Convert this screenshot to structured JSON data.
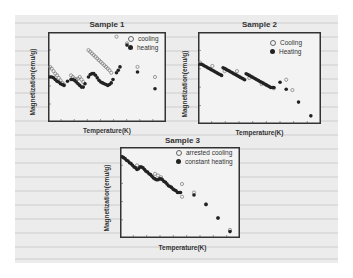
{
  "figure": {
    "background_color": "#ececec"
  },
  "chart_data": [
    {
      "type": "scatter",
      "title": "Sample 1",
      "xlabel": "Temperature(K)",
      "ylabel": "Magnetization(emu/g)",
      "grid": false,
      "legend_position": "upper right",
      "series": [
        {
          "name": "cooling",
          "marker": "open-circle",
          "points": [
            [
              0,
              0.62
            ],
            [
              0.5,
              0.6
            ],
            [
              1,
              0.57
            ],
            [
              1.5,
              0.54
            ],
            [
              2,
              0.52
            ],
            [
              2.5,
              0.49
            ],
            [
              3,
              0.46
            ],
            [
              3.5,
              0.43
            ],
            [
              4,
              0.41
            ],
            [
              6,
              0.52
            ],
            [
              6.5,
              0.5
            ],
            [
              7,
              0.48
            ],
            [
              7.5,
              0.47
            ],
            [
              8,
              0.48
            ],
            [
              8.5,
              0.5
            ],
            [
              9,
              0.47
            ],
            [
              9.5,
              0.44
            ],
            [
              11,
              0.82
            ],
            [
              11.5,
              0.8
            ],
            [
              12,
              0.78
            ],
            [
              12.5,
              0.76
            ],
            [
              13,
              0.74
            ],
            [
              13.5,
              0.72
            ],
            [
              14,
              0.7
            ],
            [
              14.5,
              0.68
            ],
            [
              15,
              0.66
            ],
            [
              15.5,
              0.64
            ],
            [
              16,
              0.62
            ],
            [
              16.5,
              0.6
            ],
            [
              17,
              0.58
            ],
            [
              17.5,
              0.55
            ],
            [
              19,
              0.98
            ],
            [
              22,
              0.9
            ],
            [
              25,
              0.62
            ],
            [
              30,
              0.5
            ]
          ]
        },
        {
          "name": "heating",
          "marker": "filled-circle",
          "points": [
            [
              0,
              0.5
            ],
            [
              0.5,
              0.5
            ],
            [
              1,
              0.49
            ],
            [
              1.5,
              0.47
            ],
            [
              2,
              0.45
            ],
            [
              2.5,
              0.44
            ],
            [
              3,
              0.42
            ],
            [
              3.5,
              0.41
            ],
            [
              4,
              0.4
            ],
            [
              5,
              0.45
            ],
            [
              6,
              0.47
            ],
            [
              6.5,
              0.47
            ],
            [
              7,
              0.46
            ],
            [
              7.5,
              0.44
            ],
            [
              8,
              0.42
            ],
            [
              8.5,
              0.4
            ],
            [
              9,
              0.38
            ],
            [
              9.5,
              0.38
            ],
            [
              10,
              0.42
            ],
            [
              11,
              0.5
            ],
            [
              11.5,
              0.53
            ],
            [
              12,
              0.54
            ],
            [
              12.5,
              0.54
            ],
            [
              13,
              0.52
            ],
            [
              13.5,
              0.49
            ],
            [
              14,
              0.46
            ],
            [
              14.5,
              0.44
            ],
            [
              15,
              0.43
            ],
            [
              15.5,
              0.42
            ],
            [
              16,
              0.41
            ],
            [
              16.5,
              0.4
            ],
            [
              17,
              0.41
            ],
            [
              17.5,
              0.43
            ],
            [
              18,
              0.47
            ],
            [
              19,
              0.55
            ],
            [
              19.5,
              0.58
            ],
            [
              20,
              0.62
            ],
            [
              22,
              0.88
            ],
            [
              25,
              0.56
            ],
            [
              30,
              0.36
            ]
          ]
        }
      ]
    },
    {
      "type": "scatter",
      "title": "Sample 2",
      "xlabel": "Temperature(K)",
      "ylabel": "Magnetization(emu/g)",
      "grid": false,
      "legend_position": "upper right",
      "series": [
        {
          "name": "Cooling",
          "marker": "open-circle",
          "points": [
            [
              0,
              0.68
            ],
            [
              4,
              0.64
            ],
            [
              8,
              0.58
            ],
            [
              12,
              0.58
            ],
            [
              16,
              0.5
            ],
            [
              20,
              0.43
            ],
            [
              24,
              0.38
            ],
            [
              28,
              0.48
            ],
            [
              30,
              0.36
            ]
          ]
        },
        {
          "name": "Heating",
          "marker": "filled-circle",
          "points": [
            [
              0,
              0.66
            ],
            [
              0.5,
              0.66
            ],
            [
              1,
              0.65
            ],
            [
              1.5,
              0.64
            ],
            [
              2,
              0.63
            ],
            [
              2.5,
              0.62
            ],
            [
              3,
              0.61
            ],
            [
              3.5,
              0.6
            ],
            [
              4,
              0.59
            ],
            [
              4.5,
              0.58
            ],
            [
              5,
              0.57
            ],
            [
              5.5,
              0.56
            ],
            [
              6,
              0.55
            ],
            [
              6.5,
              0.54
            ],
            [
              7,
              0.53
            ],
            [
              7.5,
              0.62
            ],
            [
              8,
              0.61
            ],
            [
              8.5,
              0.6
            ],
            [
              9,
              0.59
            ],
            [
              9.5,
              0.58
            ],
            [
              10,
              0.57
            ],
            [
              10.5,
              0.56
            ],
            [
              11,
              0.55
            ],
            [
              11.5,
              0.54
            ],
            [
              12,
              0.53
            ],
            [
              12.5,
              0.52
            ],
            [
              13,
              0.51
            ],
            [
              13.5,
              0.5
            ],
            [
              14,
              0.49
            ],
            [
              14.5,
              0.48
            ],
            [
              15,
              0.55
            ],
            [
              15.5,
              0.54
            ],
            [
              16,
              0.53
            ],
            [
              16.5,
              0.52
            ],
            [
              17,
              0.51
            ],
            [
              17.5,
              0.5
            ],
            [
              18,
              0.49
            ],
            [
              18.5,
              0.48
            ],
            [
              19,
              0.47
            ],
            [
              19.5,
              0.46
            ],
            [
              20,
              0.45
            ],
            [
              20.5,
              0.44
            ],
            [
              21,
              0.43
            ],
            [
              21.5,
              0.42
            ],
            [
              22,
              0.41
            ],
            [
              22.5,
              0.4
            ],
            [
              23,
              0.39
            ],
            [
              23.5,
              0.39
            ],
            [
              24,
              0.39
            ],
            [
              26,
              0.45
            ],
            [
              28,
              0.37
            ],
            [
              32,
              0.22
            ],
            [
              36,
              0.06
            ]
          ]
        }
      ]
    },
    {
      "type": "scatter",
      "title": "Sample 3",
      "xlabel": "Temperature(K)",
      "ylabel": "Magnetization(emu/g)",
      "grid": false,
      "legend_position": "upper right",
      "series": [
        {
          "name": "arrested cooling",
          "marker": "open-circle",
          "points": [
            [
              0,
              0.92
            ],
            [
              5,
              0.82
            ],
            [
              6,
              0.8
            ],
            [
              11,
              0.72
            ],
            [
              12,
              0.7
            ],
            [
              13,
              0.68
            ],
            [
              20,
              0.6
            ],
            [
              20,
              0.45
            ],
            [
              24,
              0.5
            ],
            [
              28,
              0.36
            ],
            [
              32,
              0.2
            ],
            [
              36,
              0.06
            ]
          ]
        },
        {
          "name": "constant heating",
          "marker": "filled-circle",
          "points": [
            [
              0,
              0.92
            ],
            [
              0.5,
              0.91
            ],
            [
              1,
              0.9
            ],
            [
              1.5,
              0.88
            ],
            [
              2,
              0.87
            ],
            [
              2.5,
              0.85
            ],
            [
              3,
              0.84
            ],
            [
              3.5,
              0.82
            ],
            [
              4,
              0.8
            ],
            [
              4.5,
              0.79
            ],
            [
              5,
              0.77
            ],
            [
              5.5,
              0.78
            ],
            [
              6,
              0.8
            ],
            [
              6.5,
              0.8
            ],
            [
              7,
              0.79
            ],
            [
              7.5,
              0.77
            ],
            [
              8,
              0.75
            ],
            [
              8.5,
              0.74
            ],
            [
              9,
              0.72
            ],
            [
              9.5,
              0.71
            ],
            [
              10,
              0.69
            ],
            [
              10.5,
              0.67
            ],
            [
              11,
              0.66
            ],
            [
              11.5,
              0.65
            ],
            [
              12,
              0.65
            ],
            [
              12.5,
              0.66
            ],
            [
              13,
              0.66
            ],
            [
              13.5,
              0.65
            ],
            [
              14,
              0.63
            ],
            [
              14.5,
              0.62
            ],
            [
              15,
              0.6
            ],
            [
              15.5,
              0.58
            ],
            [
              16,
              0.57
            ],
            [
              16.5,
              0.56
            ],
            [
              17,
              0.54
            ],
            [
              17.5,
              0.53
            ],
            [
              18,
              0.52
            ],
            [
              18.5,
              0.5
            ],
            [
              19,
              0.5
            ],
            [
              19.5,
              0.5
            ],
            [
              24,
              0.47
            ],
            [
              28,
              0.36
            ],
            [
              32,
              0.2
            ],
            [
              36,
              0.04
            ]
          ]
        }
      ]
    }
  ]
}
